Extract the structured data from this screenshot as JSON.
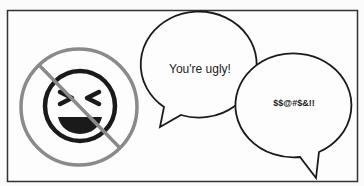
{
  "illustration": {
    "bubble_left": {
      "text": "You're ugly!"
    },
    "bubble_right": {
      "text": "$$@#$&!!"
    },
    "prohibited_icon": "laughing-face-icon",
    "colors": {
      "frame": "#333333",
      "prohibition": "#8a8a8a",
      "stroke": "#1a1a1a",
      "background": "#fbfbfb"
    }
  }
}
